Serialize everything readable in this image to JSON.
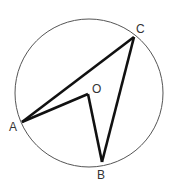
{
  "diagram": {
    "type": "geometry-circle",
    "circle": {
      "center": "O",
      "cx": 89,
      "cy": 93,
      "r": 74,
      "stroke": "#555555"
    },
    "points": [
      {
        "id": "A",
        "label": "A",
        "x": 22,
        "y": 122
      },
      {
        "id": "B",
        "label": "B",
        "x": 102,
        "y": 162
      },
      {
        "id": "C",
        "label": "C",
        "x": 134,
        "y": 37
      },
      {
        "id": "O",
        "label": "O",
        "x": 88,
        "y": 94
      }
    ],
    "segments": [
      [
        "A",
        "C"
      ],
      [
        "C",
        "B"
      ],
      [
        "B",
        "O"
      ],
      [
        "O",
        "A"
      ]
    ],
    "segment_color": "#111111",
    "labels": {
      "A": "A",
      "B": "B",
      "C": "C",
      "O": "O"
    }
  }
}
